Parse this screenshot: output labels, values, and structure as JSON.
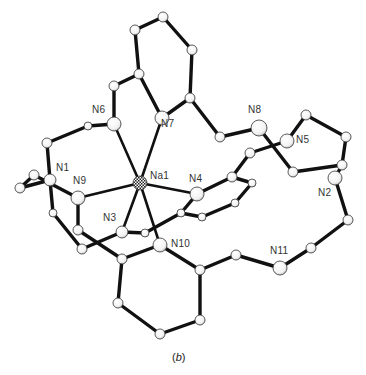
{
  "figure": {
    "caption": "(b)",
    "caption_letter": "b",
    "central_atom": "Na1",
    "colors": {
      "bond": "#111111",
      "atom_fill": "#ffffff",
      "atom_stroke": "#333333",
      "label": "#333333"
    }
  },
  "atoms": [
    {
      "id": "Na1",
      "label": "Na1",
      "x": 140,
      "y": 183,
      "r": 7,
      "type": "metal",
      "labeled": true,
      "lx": 150,
      "ly": 170
    },
    {
      "id": "N1",
      "label": "N1",
      "x": 50,
      "y": 180,
      "r": 6,
      "type": "N",
      "labeled": true,
      "lx": 56,
      "ly": 162
    },
    {
      "id": "N2",
      "label": "N2",
      "x": 335,
      "y": 178,
      "r": 7,
      "type": "N",
      "labeled": true,
      "lx": 318,
      "ly": 187
    },
    {
      "id": "N3",
      "label": "N3",
      "x": 122,
      "y": 232,
      "r": 6,
      "type": "N",
      "labeled": true,
      "lx": 103,
      "ly": 212
    },
    {
      "id": "N4",
      "label": "N4",
      "x": 197,
      "y": 194,
      "r": 7,
      "type": "N",
      "labeled": true,
      "lx": 189,
      "ly": 173
    },
    {
      "id": "N5",
      "label": "N5",
      "x": 287,
      "y": 141,
      "r": 7,
      "type": "N",
      "labeled": true,
      "lx": 296,
      "ly": 134
    },
    {
      "id": "N6",
      "label": "N6",
      "x": 114,
      "y": 124,
      "r": 7,
      "type": "N",
      "labeled": true,
      "lx": 92,
      "ly": 104
    },
    {
      "id": "N7",
      "label": "N7",
      "x": 162,
      "y": 118,
      "r": 7,
      "type": "N",
      "labeled": true,
      "lx": 161,
      "ly": 118
    },
    {
      "id": "N8",
      "label": "N8",
      "x": 259,
      "y": 128,
      "r": 8,
      "type": "N",
      "labeled": true,
      "lx": 248,
      "ly": 104
    },
    {
      "id": "N9",
      "label": "N9",
      "x": 78,
      "y": 198,
      "r": 7,
      "type": "N",
      "labeled": true,
      "lx": 73,
      "ly": 175
    },
    {
      "id": "N10",
      "label": "N10",
      "x": 160,
      "y": 245,
      "r": 7,
      "type": "N",
      "labeled": true,
      "lx": 171,
      "ly": 238
    },
    {
      "id": "N11",
      "label": "N11",
      "x": 280,
      "y": 268,
      "r": 7,
      "type": "N",
      "labeled": true,
      "lx": 270,
      "ly": 245
    },
    {
      "id": "C1",
      "x": 163,
      "y": 17,
      "r": 5
    },
    {
      "id": "C2",
      "x": 135,
      "y": 30,
      "r": 5
    },
    {
      "id": "C3",
      "x": 192,
      "y": 50,
      "r": 5
    },
    {
      "id": "C4",
      "x": 190,
      "y": 98,
      "r": 5
    },
    {
      "id": "C5",
      "x": 139,
      "y": 74,
      "r": 5
    },
    {
      "id": "C6",
      "x": 114,
      "y": 86,
      "r": 5
    },
    {
      "id": "C7",
      "x": 88,
      "y": 126,
      "r": 4
    },
    {
      "id": "C8",
      "x": 47,
      "y": 143,
      "r": 5
    },
    {
      "id": "C9",
      "x": 220,
      "y": 137,
      "r": 5
    },
    {
      "id": "C10",
      "x": 306,
      "y": 115,
      "r": 5
    },
    {
      "id": "C11",
      "x": 346,
      "y": 137,
      "r": 5
    },
    {
      "id": "C12",
      "x": 342,
      "y": 165,
      "r": 5
    },
    {
      "id": "C13",
      "x": 293,
      "y": 172,
      "r": 5
    },
    {
      "id": "C14",
      "x": 250,
      "y": 153,
      "r": 5
    },
    {
      "id": "C15",
      "x": 232,
      "y": 177,
      "r": 5
    },
    {
      "id": "C16",
      "x": 252,
      "y": 183,
      "r": 4
    },
    {
      "id": "C17",
      "x": 235,
      "y": 203,
      "r": 4
    },
    {
      "id": "C18",
      "x": 202,
      "y": 217,
      "r": 4
    },
    {
      "id": "C19",
      "x": 181,
      "y": 213,
      "r": 4
    },
    {
      "id": "C20",
      "x": 145,
      "y": 233,
      "r": 4
    },
    {
      "id": "C21",
      "x": 34,
      "y": 175,
      "r": 5
    },
    {
      "id": "C22",
      "x": 20,
      "y": 188,
      "r": 5
    },
    {
      "id": "C23",
      "x": 53,
      "y": 213,
      "r": 4
    },
    {
      "id": "C24",
      "x": 78,
      "y": 230,
      "r": 5
    },
    {
      "id": "C25",
      "x": 82,
      "y": 249,
      "r": 5
    },
    {
      "id": "C26",
      "x": 122,
      "y": 259,
      "r": 5
    },
    {
      "id": "C27",
      "x": 118,
      "y": 303,
      "r": 5
    },
    {
      "id": "C28",
      "x": 160,
      "y": 334,
      "r": 5
    },
    {
      "id": "C29",
      "x": 200,
      "y": 320,
      "r": 5
    },
    {
      "id": "C30",
      "x": 200,
      "y": 270,
      "r": 5
    },
    {
      "id": "C31",
      "x": 236,
      "y": 255,
      "r": 5
    },
    {
      "id": "C32",
      "x": 311,
      "y": 248,
      "r": 5
    },
    {
      "id": "C33",
      "x": 348,
      "y": 220,
      "r": 5
    }
  ],
  "bonds": [
    [
      "Na1",
      "N6"
    ],
    [
      "Na1",
      "N7"
    ],
    [
      "Na1",
      "N9"
    ],
    [
      "Na1",
      "N4"
    ],
    [
      "Na1",
      "N3"
    ],
    [
      "Na1",
      "N10"
    ],
    [
      "C2",
      "C1"
    ],
    [
      "C1",
      "C3"
    ],
    [
      "C3",
      "C4"
    ],
    [
      "C4",
      "N7"
    ],
    [
      "C2",
      "C5"
    ],
    [
      "C5",
      "N7"
    ],
    [
      "C5",
      "C6"
    ],
    [
      "C6",
      "N6"
    ],
    [
      "N6",
      "C7"
    ],
    [
      "C7",
      "C8"
    ],
    [
      "C8",
      "N1"
    ],
    [
      "C4",
      "C9"
    ],
    [
      "C9",
      "N8"
    ],
    [
      "N8",
      "C13"
    ],
    [
      "C13",
      "C12"
    ],
    [
      "C12",
      "C11"
    ],
    [
      "C11",
      "C10"
    ],
    [
      "C10",
      "N5"
    ],
    [
      "N5",
      "C14"
    ],
    [
      "C14",
      "C15"
    ],
    [
      "C15",
      "N4"
    ],
    [
      "C15",
      "C16"
    ],
    [
      "C16",
      "C17"
    ],
    [
      "C17",
      "C18"
    ],
    [
      "C18",
      "C19"
    ],
    [
      "C19",
      "N4"
    ],
    [
      "C19",
      "C20"
    ],
    [
      "C20",
      "N3"
    ],
    [
      "N3",
      "C25"
    ],
    [
      "C12",
      "N2"
    ],
    [
      "N2",
      "C33"
    ],
    [
      "C33",
      "C32"
    ],
    [
      "C32",
      "N11"
    ],
    [
      "N11",
      "C31"
    ],
    [
      "C31",
      "C30"
    ],
    [
      "C30",
      "N10"
    ],
    [
      "C30",
      "C29"
    ],
    [
      "C29",
      "C28"
    ],
    [
      "C28",
      "C27"
    ],
    [
      "C27",
      "C26"
    ],
    [
      "C26",
      "N10"
    ],
    [
      "C26",
      "C24"
    ],
    [
      "C24",
      "N9"
    ],
    [
      "N9",
      "C21"
    ],
    [
      "C21",
      "C22"
    ],
    [
      "C22",
      "N1"
    ],
    [
      "N1",
      "C23"
    ],
    [
      "C23",
      "C25"
    ]
  ]
}
